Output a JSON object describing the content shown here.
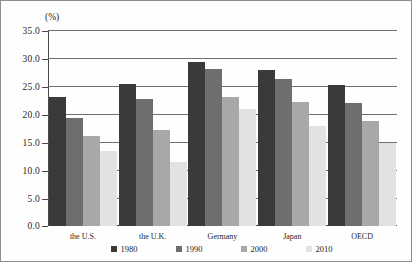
{
  "chart_data": {
    "type": "bar",
    "title": "",
    "xlabel": "",
    "ylabel": "(%)",
    "ylim": [
      0.0,
      35.0
    ],
    "ytick_step": 5.0,
    "yticks": [
      "35.0",
      "30.0",
      "25.0",
      "20.0",
      "15.0",
      "10.0",
      "5.0",
      "0.0"
    ],
    "ytick_values": [
      35.0,
      30.0,
      25.0,
      20.0,
      15.0,
      10.0,
      5.0,
      0.0
    ],
    "grid": true,
    "legend_position": "bottom",
    "categories": [
      "the U.S.",
      "the U.K.",
      "Germany",
      "Japan",
      "OECD"
    ],
    "series": [
      {
        "name": "1980",
        "color": "#3a3a3a",
        "values": [
          23.1,
          25.3,
          29.3,
          27.8,
          25.2
        ]
      },
      {
        "name": "1990",
        "color": "#6e6e6e",
        "values": [
          19.3,
          22.7,
          28.1,
          26.3,
          22.0
        ]
      },
      {
        "name": "2000",
        "color": "#a8a8a8",
        "values": [
          16.0,
          17.2,
          23.0,
          22.1,
          18.7
        ]
      },
      {
        "name": "2010",
        "color": "#e2e2e2",
        "values": [
          13.4,
          11.5,
          20.9,
          17.8,
          14.8
        ]
      }
    ]
  },
  "colors": {
    "axis": "#4a4a4a",
    "gridline": "#6f6f6f",
    "frame": "#8d8d8d",
    "background": "#fefefe",
    "text": "#1f1f1f"
  }
}
